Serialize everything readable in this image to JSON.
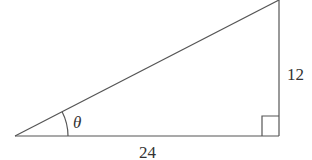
{
  "diagram": {
    "type": "right-triangle",
    "colors": {
      "stroke": "#555555",
      "text": "#333333",
      "background": "#ffffff"
    },
    "vertices": {
      "left": [
        15,
        136
      ],
      "right_angle": [
        279,
        136
      ],
      "top": [
        279,
        0
      ]
    },
    "labels": {
      "angle": "θ",
      "base": "24",
      "height": "12"
    },
    "right_angle_marker": true
  }
}
